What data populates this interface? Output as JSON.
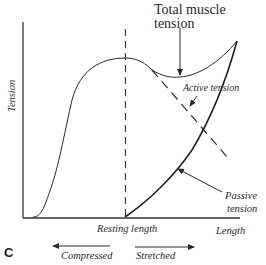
{
  "diagram": {
    "type": "length-tension curve",
    "panel_label": "C",
    "axes": {
      "y_label": "Tension",
      "x_label": "Length",
      "x_marker_label": "Resting length"
    },
    "curves": [
      {
        "name": "Total muscle tension",
        "style": "solid thin"
      },
      {
        "name": "Active tension",
        "style": "solid then dashed"
      },
      {
        "name": "Passive tension",
        "style": "solid thick"
      }
    ],
    "annotations": {
      "total": "Total muscle tension",
      "total_line1": "Total muscle",
      "total_line2": "tension",
      "active": "Active tension",
      "passive_line1": "Passive",
      "passive_line2": "tension"
    },
    "direction_arrows": {
      "left": "Compressed",
      "right": "Stretched"
    },
    "colors": {
      "line": "#2a2a2a",
      "background": "#ffffff"
    }
  }
}
